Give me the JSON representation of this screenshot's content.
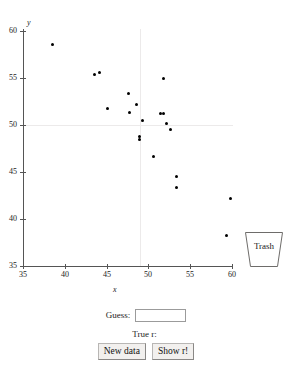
{
  "chart_data": {
    "type": "scatter",
    "title": "",
    "xlabel": "x",
    "ylabel": "y",
    "xlim": [
      35,
      60
    ],
    "ylim": [
      35,
      60
    ],
    "xticks": [
      35,
      40,
      45,
      50,
      55,
      60
    ],
    "yticks": [
      35,
      40,
      45,
      50,
      55,
      60
    ],
    "grid": true,
    "gridlines": {
      "horizontal": [
        50
      ],
      "vertical": [
        50
      ]
    },
    "legend": "none",
    "series": [
      {
        "name": "points",
        "marker": "filled-circle",
        "color": "#000000",
        "points": [
          {
            "x": 38.5,
            "y": 58.6
          },
          {
            "x": 43.5,
            "y": 55.4
          },
          {
            "x": 44.1,
            "y": 55.6
          },
          {
            "x": 45.1,
            "y": 51.8
          },
          {
            "x": 47.6,
            "y": 53.4
          },
          {
            "x": 47.7,
            "y": 51.3
          },
          {
            "x": 48.6,
            "y": 52.2
          },
          {
            "x": 48.9,
            "y": 48.8
          },
          {
            "x": 48.9,
            "y": 48.5
          },
          {
            "x": 49.3,
            "y": 50.5
          },
          {
            "x": 50.6,
            "y": 46.7
          },
          {
            "x": 51.5,
            "y": 51.2
          },
          {
            "x": 51.8,
            "y": 51.2
          },
          {
            "x": 51.8,
            "y": 55.0
          },
          {
            "x": 52.1,
            "y": 50.2
          },
          {
            "x": 52.6,
            "y": 49.5
          },
          {
            "x": 53.3,
            "y": 44.5
          },
          {
            "x": 53.3,
            "y": 43.4
          },
          {
            "x": 59.3,
            "y": 38.2
          },
          {
            "x": 59.8,
            "y": 42.2
          }
        ]
      }
    ]
  },
  "trash": {
    "label": "Trash"
  },
  "controls": {
    "guess_label": "Guess:",
    "guess_value": "",
    "guess_placeholder": "",
    "true_r_label": "True r:",
    "true_r_value": "",
    "new_data_label": "New data",
    "show_r_label": "Show r!"
  }
}
